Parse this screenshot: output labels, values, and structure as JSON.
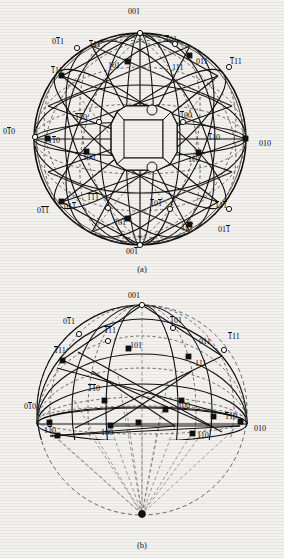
{
  "figure": {
    "panels": [
      {
        "id": "a",
        "caption": "(a)",
        "description": "Full sphere projection with central crystal polyhedron and great circles through crystallographic poles",
        "has_crystal": true,
        "labels": [
          {
            "text": "001",
            "bars": [],
            "x": 128,
            "y": 8,
            "pole": "001"
          },
          {
            "text": "011",
            "bars": [
              1
            ],
            "x": 52,
            "y": 38,
            "pole": "0-11"
          },
          {
            "text": "111",
            "bars": [
              0
            ],
            "x": 89,
            "y": 41,
            "pole": "-111"
          },
          {
            "text": "101",
            "bars": [
              0
            ],
            "x": 165,
            "y": 36,
            "pole": "-101"
          },
          {
            "text": "101",
            "bars": [],
            "x": 108,
            "y": 62,
            "pole": "101"
          },
          {
            "text": "011",
            "bars": [],
            "x": 196,
            "y": 58,
            "pole": "011"
          },
          {
            "text": "111",
            "bars": [
              0
            ],
            "x": 230,
            "y": 58,
            "pole": "-111b"
          },
          {
            "text": "111",
            "bars": [],
            "x": 172,
            "y": 64,
            "pole": "111"
          },
          {
            "text": "111",
            "bars": [
              0
            ],
            "x": 51,
            "y": 67,
            "pole": "-1-11"
          },
          {
            "text": "110",
            "bars": [
              0,
              1
            ],
            "x": 75,
            "y": 114,
            "pole": "-1-10"
          },
          {
            "text": "100",
            "bars": [
              0
            ],
            "x": 180,
            "y": 112,
            "pole": "-100"
          },
          {
            "text": "010",
            "bars": [
              1
            ],
            "x": 3,
            "y": 128,
            "pole": "0-10"
          },
          {
            "text": "110",
            "bars": [
              1
            ],
            "x": 48,
            "y": 137,
            "pole": "1-10"
          },
          {
            "text": "110",
            "bars": [
              0
            ],
            "x": 208,
            "y": 134,
            "pole": "-110"
          },
          {
            "text": "010",
            "bars": [],
            "x": 259,
            "y": 140,
            "pole": "010"
          },
          {
            "text": "100",
            "bars": [],
            "x": 83,
            "y": 154,
            "pole": "100"
          },
          {
            "text": "110",
            "bars": [],
            "x": 188,
            "y": 156,
            "pole": "110"
          },
          {
            "text": "111",
            "bars": [
              0,
              1,
              2
            ],
            "x": 87,
            "y": 194,
            "pole": "-1-1-1"
          },
          {
            "text": "101",
            "bars": [
              0,
              2
            ],
            "x": 150,
            "y": 200,
            "pole": "-10-1"
          },
          {
            "text": "111",
            "bars": [
              0,
              2
            ],
            "x": 215,
            "y": 202,
            "pole": "-11-1"
          },
          {
            "text": "011",
            "bars": [
              1,
              2
            ],
            "x": 37,
            "y": 207,
            "pole": "0-1-1"
          },
          {
            "text": "011",
            "bars": [
              2
            ],
            "x": 64,
            "y": 203,
            "pole": "01-1b"
          },
          {
            "text": "101",
            "bars": [
              2
            ],
            "x": 114,
            "y": 219,
            "pole": "10-1"
          },
          {
            "text": "111",
            "bars": [
              2
            ],
            "x": 181,
            "y": 224,
            "pole": "11-1"
          },
          {
            "text": "011",
            "bars": [
              2
            ],
            "x": 218,
            "y": 226,
            "pole": "01-1"
          },
          {
            "text": "001",
            "bars": [
              2
            ],
            "x": 126,
            "y": 248,
            "pole": "00-1"
          }
        ]
      },
      {
        "id": "b",
        "caption": "(b)",
        "description": "Upper hemisphere projection with projection lines converging to the south pole",
        "has_crystal": false,
        "labels": [
          {
            "text": "001",
            "bars": [],
            "x": 128,
            "y": 292,
            "pole": "001"
          },
          {
            "text": "011",
            "bars": [
              1
            ],
            "x": 63,
            "y": 318,
            "pole": "0-11"
          },
          {
            "text": "111",
            "bars": [
              0,
              1
            ],
            "x": 104,
            "y": 327,
            "pole": "-1-11"
          },
          {
            "text": "101",
            "bars": [
              0
            ],
            "x": 170,
            "y": 317,
            "pole": "-101"
          },
          {
            "text": "101",
            "bars": [],
            "x": 130,
            "y": 342,
            "pole": "101"
          },
          {
            "text": "011",
            "bars": [],
            "x": 199,
            "y": 338,
            "pole": "011"
          },
          {
            "text": "111",
            "bars": [
              0
            ],
            "x": 228,
            "y": 333,
            "pole": "-111"
          },
          {
            "text": "111",
            "bars": [
              0
            ],
            "x": 54,
            "y": 347,
            "pole": "-111b"
          },
          {
            "text": "111",
            "bars": [],
            "x": 195,
            "y": 360,
            "pole": "111"
          },
          {
            "text": "110",
            "bars": [
              0,
              1
            ],
            "x": 88,
            "y": 385,
            "pole": "-1-10"
          },
          {
            "text": "100",
            "bars": [
              0
            ],
            "x": 178,
            "y": 402,
            "pole": "-100"
          },
          {
            "text": "010",
            "bars": [
              1
            ],
            "x": 24,
            "y": 403,
            "pole": "0-10"
          },
          {
            "text": "110",
            "bars": [
              0
            ],
            "x": 225,
            "y": 413,
            "pole": "-110"
          },
          {
            "text": "110",
            "bars": [
              1
            ],
            "x": 44,
            "y": 427,
            "pole": "1-10"
          },
          {
            "text": "100",
            "bars": [],
            "x": 101,
            "y": 429,
            "pole": "100"
          },
          {
            "text": "110",
            "bars": [],
            "x": 197,
            "y": 432,
            "pole": "110"
          },
          {
            "text": "010",
            "bars": [],
            "x": 254,
            "y": 425,
            "pole": "010"
          }
        ]
      }
    ]
  },
  "colors": {
    "ink": "#111111",
    "paper": "#f2f1ee",
    "dashed": "#555555",
    "filled_pole": "#111111",
    "open_pole": "#ffffff"
  }
}
